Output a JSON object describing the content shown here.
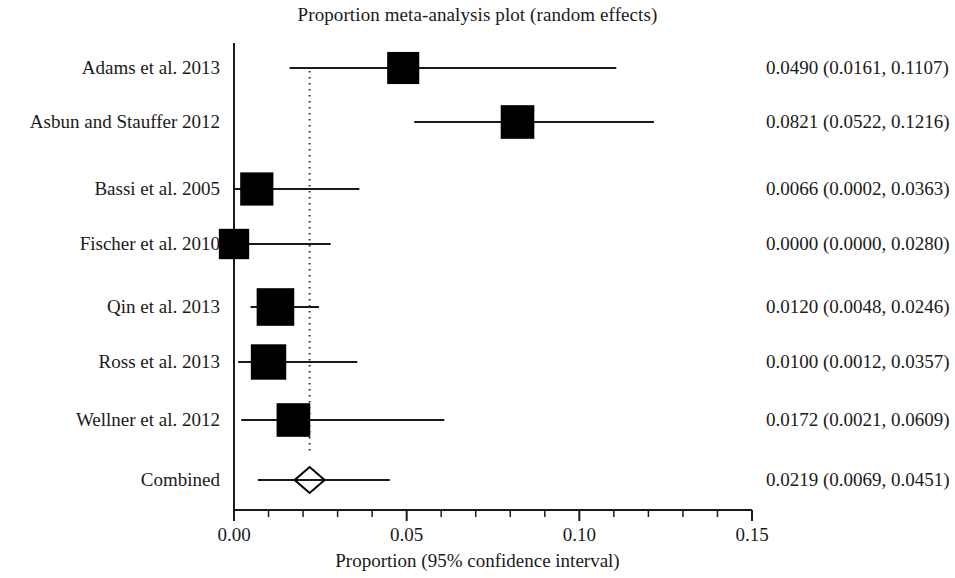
{
  "chart_data": {
    "type": "forest",
    "title": "Proportion meta-analysis plot (random effects)",
    "xlabel": "Proportion (95% confidence interval)",
    "ylabel": "",
    "xlim": [
      0.0,
      0.15
    ],
    "xticks": [
      0.0,
      0.05,
      0.1,
      0.15
    ],
    "xtick_labels": [
      "0.00",
      "0.05",
      "0.10",
      "0.15"
    ],
    "minor_tick_step": 0.01,
    "grid": false,
    "legend": null,
    "reference_line": 0.0219,
    "reference_line_style": "dotted",
    "categories": [
      "Adams et al. 2013",
      "Asbun and Stauffer 2012",
      "Bassi et al. 2005",
      "Fischer et al. 2010",
      "Qin et al. 2013",
      "Ross et al. 2013",
      "Wellner et al. 2012",
      "Combined"
    ],
    "rows": [
      {
        "study": "Adams et al. 2013",
        "estimate": 0.049,
        "ci_low": 0.0161,
        "ci_high": 0.1107,
        "marker": "square",
        "weight_box": 0.55,
        "stat_text": "0.0490 (0.0161, 0.1107)"
      },
      {
        "study": "Asbun and Stauffer 2012",
        "estimate": 0.0821,
        "ci_low": 0.0522,
        "ci_high": 0.1216,
        "marker": "square",
        "weight_box": 0.62,
        "stat_text": "0.0821 (0.0522, 0.1216)"
      },
      {
        "study": "Bassi et al. 2005",
        "estimate": 0.0066,
        "ci_low": 0.0002,
        "ci_high": 0.0363,
        "marker": "square",
        "weight_box": 0.6,
        "stat_text": "0.0066 (0.0002, 0.0363)"
      },
      {
        "study": "Fischer et al. 2010",
        "estimate": 0.0,
        "ci_low": 0.0,
        "ci_high": 0.028,
        "marker": "square",
        "weight_box": 0.47,
        "stat_text": "0.0000 (0.0000, 0.0280)"
      },
      {
        "study": "Qin et al. 2013",
        "estimate": 0.012,
        "ci_low": 0.0048,
        "ci_high": 0.0246,
        "marker": "square",
        "weight_box": 0.8,
        "stat_text": "0.0120 (0.0048, 0.0246)"
      },
      {
        "study": "Ross et al. 2013",
        "estimate": 0.01,
        "ci_low": 0.0012,
        "ci_high": 0.0357,
        "marker": "square",
        "weight_box": 0.7,
        "stat_text": "0.0100 (0.0012, 0.0357)"
      },
      {
        "study": "Wellner et al. 2012",
        "estimate": 0.0172,
        "ci_low": 0.0021,
        "ci_high": 0.0609,
        "marker": "square",
        "weight_box": 0.62,
        "stat_text": "0.0172 (0.0021, 0.0609)"
      },
      {
        "study": "Combined",
        "estimate": 0.0219,
        "ci_low": 0.0069,
        "ci_high": 0.0451,
        "marker": "diamond",
        "weight_box": 0.0,
        "stat_text": "0.0219 (0.0069, 0.0451)"
      }
    ],
    "colors": {
      "marker": "#000000",
      "line": "#1a1a1a",
      "axis": "#1a1a1a",
      "reference": "#333333",
      "background": "#ffffff"
    }
  }
}
